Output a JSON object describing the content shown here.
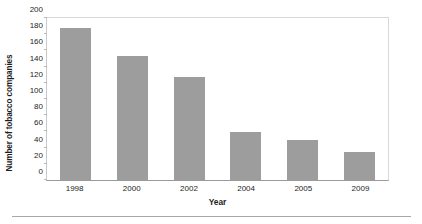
{
  "chart_data": {
    "type": "bar",
    "title": "",
    "xlabel": "Year",
    "ylabel": "Number of tobacco companies",
    "categories": [
      "1998",
      "2000",
      "2002",
      "2004",
      "2005",
      "2009"
    ],
    "values": [
      188,
      153,
      127,
      59,
      49,
      35
    ],
    "ylim": [
      0,
      200
    ],
    "yticks": [
      0,
      20,
      40,
      60,
      80,
      100,
      120,
      140,
      160,
      180,
      200
    ],
    "ytick_labels": [
      "0",
      "20",
      "40",
      "60",
      "80",
      "100",
      "120",
      "140",
      "160",
      "180",
      "200"
    ],
    "grid": false,
    "legend": null,
    "bar_color": "#9d9d9d",
    "axis_color": "#9a9a9a",
    "text_color": "#1d1d1d"
  }
}
